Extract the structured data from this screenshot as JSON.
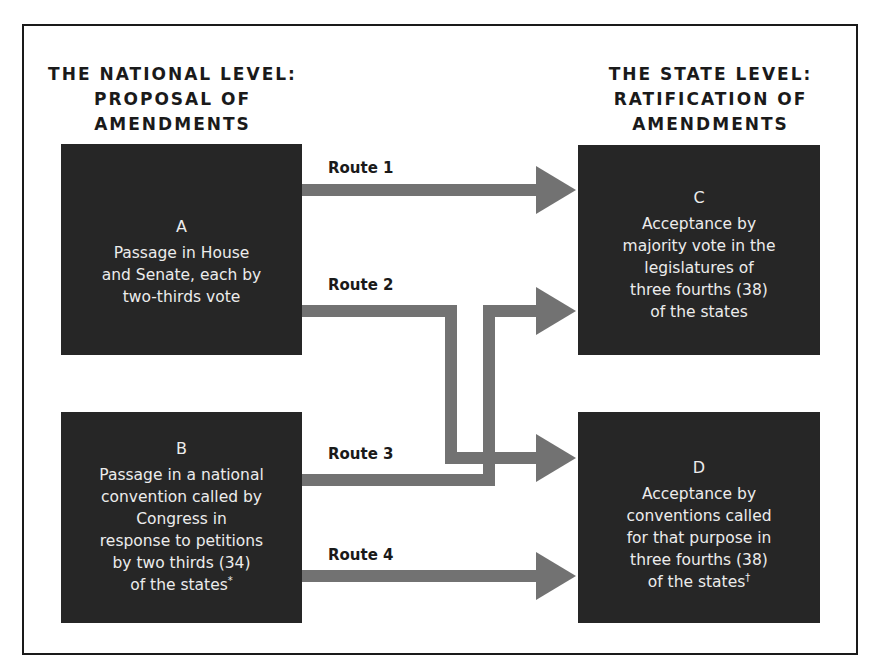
{
  "diagram": {
    "title_partial": "",
    "colors": {
      "box_fill": "#262626",
      "box_text": "#ececec",
      "arrow": "#727272",
      "frame": "#1a1a1a",
      "heading_text": "#1a1a1a"
    },
    "headings": {
      "national": {
        "lines": [
          "THE NATIONAL LEVEL:",
          "PROPOSAL OF",
          "AMENDMENTS"
        ]
      },
      "state": {
        "lines": [
          "THE STATE LEVEL:",
          "RATIFICATION OF",
          "AMENDMENTS"
        ]
      }
    },
    "boxes": {
      "a": {
        "letter": "A",
        "lines": [
          "Passage in House",
          "and Senate, each by",
          "two-thirds vote"
        ]
      },
      "b": {
        "letter": "B",
        "lines": [
          "Passage in a national",
          "convention called by",
          "Congress in",
          "response to petitions",
          "by two thirds (34)",
          "of the states"
        ],
        "footnote_mark": "*"
      },
      "c": {
        "letter": "C",
        "lines": [
          "Acceptance by",
          "majority vote in the",
          "legislatures of",
          "three fourths (38)",
          "of the states"
        ]
      },
      "d": {
        "letter": "D",
        "lines": [
          "Acceptance by",
          "conventions called",
          "for that purpose in",
          "three fourths (38)",
          "of the states"
        ],
        "footnote_mark": "†"
      }
    },
    "routes": [
      {
        "label": "Route 1",
        "from": "A",
        "to": "C"
      },
      {
        "label": "Route 2",
        "from": "A",
        "to": "D"
      },
      {
        "label": "Route 3",
        "from": "B",
        "to": "C"
      },
      {
        "label": "Route 4",
        "from": "B",
        "to": "D"
      }
    ]
  }
}
